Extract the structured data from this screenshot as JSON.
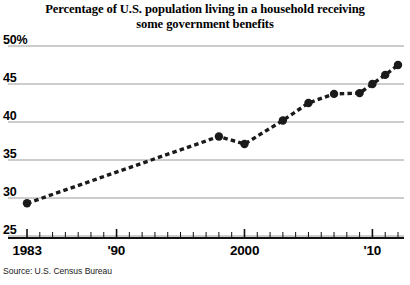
{
  "chart_data": {
    "type": "line",
    "title": "Percentage of U.S. population living in a household receiving some government benefits",
    "title_line1": "Percentage of U.S. population living in a household receiving",
    "title_line2": "some government benefits",
    "xlabel": "",
    "ylabel": "",
    "source": "Source: U.S. Census Bureau",
    "ylim": [
      25,
      50
    ],
    "xlim": [
      1983,
      2012
    ],
    "grid": "horizontal",
    "legend": "none",
    "y_ticks": [
      {
        "value": 50,
        "label": "50%"
      },
      {
        "value": 45,
        "label": "45"
      },
      {
        "value": 40,
        "label": "40"
      },
      {
        "value": 35,
        "label": "35"
      },
      {
        "value": 30,
        "label": "30"
      },
      {
        "value": 25,
        "label": "25"
      }
    ],
    "x_ticks": [
      {
        "value": 1983,
        "label": "1983"
      },
      {
        "value": 1990,
        "label": "'90"
      },
      {
        "value": 2000,
        "label": "2000"
      },
      {
        "value": 2010,
        "label": "'10"
      }
    ],
    "x_tick_minor_start": 1983,
    "x_tick_minor_end": 2012,
    "series": [
      {
        "name": "Percent of U.S. population in household receiving government benefits",
        "color": "#1a1a1a",
        "line_style": "dashed",
        "marker": "circle",
        "x": [
          1983,
          1998,
          2000,
          2003,
          2005,
          2007,
          2009,
          2010,
          2011,
          2012
        ],
        "values": [
          29.3,
          38.1,
          37.1,
          40.2,
          42.5,
          43.7,
          43.8,
          45.0,
          46.2,
          47.5
        ]
      }
    ]
  }
}
